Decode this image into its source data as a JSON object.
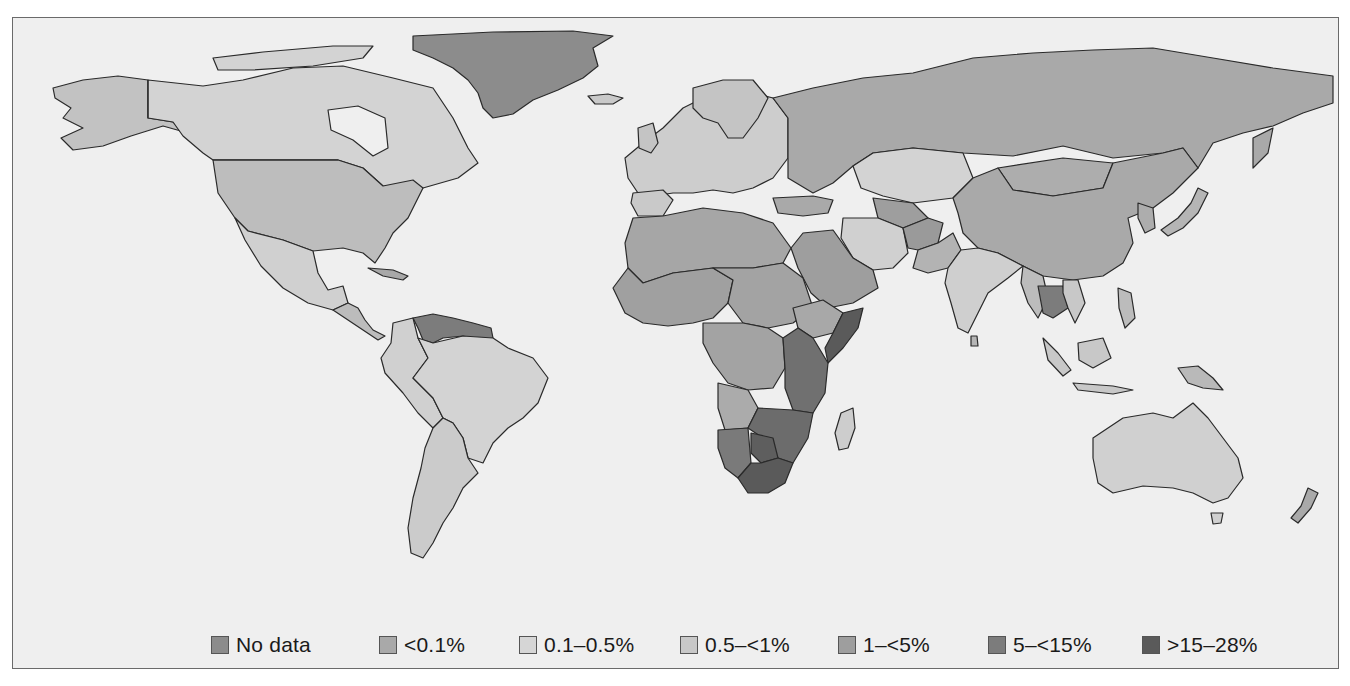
{
  "map": {
    "type": "choropleth",
    "projection": "world",
    "background_color": "#efefef",
    "ocean_color": "#efefef"
  },
  "legend": {
    "items": [
      {
        "label": "No data",
        "color": "#8c8c8c",
        "x": 198
      },
      {
        "label": "<0.1%",
        "color": "#a9a9a9",
        "x": 365
      },
      {
        "label": "0.1–0.5%",
        "color": "#d6d6d6",
        "x": 506
      },
      {
        "label": "0.5–<1%",
        "color": "#c8c8c8",
        "x": 667
      },
      {
        "label": "1–<5%",
        "color": "#9e9e9e",
        "x": 824
      },
      {
        "label": "5–<15%",
        "color": "#7c7c7c",
        "x": 975
      },
      {
        "label": ">15–28%",
        "color": "#5a5a5a",
        "x": 1129
      }
    ]
  },
  "regions": [
    {
      "name": "Greenland",
      "category": "No data"
    },
    {
      "name": "Russia",
      "category": "<0.1%"
    },
    {
      "name": "China",
      "category": "<0.1%"
    },
    {
      "name": "United States",
      "category": "0.5–<1%"
    },
    {
      "name": "Canada",
      "category": "0.1–0.5%"
    },
    {
      "name": "Alaska",
      "category": "0.5–<1%"
    },
    {
      "name": "Mexico",
      "category": "0.1–0.5%"
    },
    {
      "name": "Brazil",
      "category": "0.1–0.5%"
    },
    {
      "name": "Venezuela/Guianas",
      "category": "5–<15%"
    },
    {
      "name": "Argentina",
      "category": "0.1–0.5%"
    },
    {
      "name": "Australia",
      "category": "0.1–0.5%"
    },
    {
      "name": "New Zealand",
      "category": "<0.1%"
    },
    {
      "name": "India",
      "category": "0.1–0.5%"
    },
    {
      "name": "Kazakhstan",
      "category": "0.1–0.5%"
    },
    {
      "name": "Iran",
      "category": "0.1–0.5%"
    },
    {
      "name": "Afghanistan",
      "category": "1–<5%"
    },
    {
      "name": "Saudi Arabia",
      "category": "1–<5%"
    },
    {
      "name": "Thailand",
      "category": "5–<15%"
    },
    {
      "name": "Somalia",
      "category": ">15–28%"
    },
    {
      "name": "South Africa",
      "category": ">15–28%"
    },
    {
      "name": "Botswana",
      "category": ">15–28%"
    },
    {
      "name": "Madagascar",
      "category": "0.1–0.5%"
    },
    {
      "name": "Europe",
      "category": "0.1–0.5%"
    },
    {
      "name": "North Africa",
      "category": "1–<5%"
    },
    {
      "name": "West/Central Africa",
      "category": "1–<5%"
    }
  ]
}
